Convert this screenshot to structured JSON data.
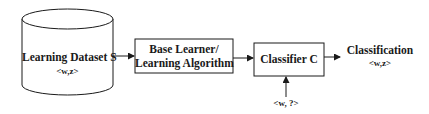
{
  "diagram": {
    "type": "flowchart",
    "nodes": [
      {
        "id": "dataset",
        "shape": "cylinder",
        "label": "Learning Dataset S",
        "sublabel": "<w,z>"
      },
      {
        "id": "learner",
        "shape": "rectangle",
        "label_line1": "Base Learner/",
        "label_line2": "Learning Algorithm"
      },
      {
        "id": "classifier",
        "shape": "rectangle",
        "label": "Classifier C"
      },
      {
        "id": "output",
        "shape": "text",
        "label": "Classification",
        "sublabel": "<w,z>"
      },
      {
        "id": "input",
        "shape": "text",
        "label": "<w, ?>"
      }
    ],
    "edges": [
      {
        "from": "dataset",
        "to": "learner"
      },
      {
        "from": "learner",
        "to": "classifier"
      },
      {
        "from": "classifier",
        "to": "output"
      },
      {
        "from": "input",
        "to": "classifier"
      }
    ],
    "colors": {
      "stroke": "#1a1a1a",
      "background": "#ffffff"
    }
  }
}
